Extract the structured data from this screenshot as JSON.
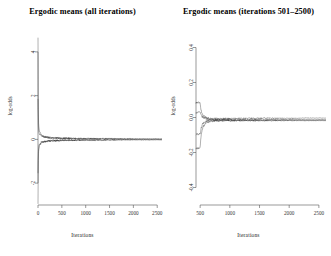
{
  "figure": {
    "background": "#ffffff",
    "axis_color": "#555555",
    "trace_color": "#333333"
  },
  "panels": [
    {
      "id": "left",
      "title": "Ergodic means (all iterations)",
      "xlabel": "Iterations",
      "ylabel": "log-odds"
    },
    {
      "id": "right",
      "title": "Ergodic means (iterations 501–2500)",
      "xlabel": "Iterations",
      "ylabel": "log-odds"
    }
  ],
  "chart_data": [
    {
      "type": "line",
      "title": "Ergodic means (all iterations)",
      "xlabel": "Iterations",
      "ylabel": "log-odds",
      "xlim": [
        0,
        2600
      ],
      "ylim": [
        -3.0,
        5.0
      ],
      "xticks": [
        0,
        500,
        1000,
        1500,
        2000,
        2500
      ],
      "xtick_labels": [
        "0",
        "500",
        "1000",
        "1500",
        "2000",
        "2500"
      ],
      "yticks": [
        -2,
        0,
        2,
        4
      ],
      "ytick_labels": [
        "-2",
        "0",
        "2",
        "4"
      ],
      "grid": false,
      "legend": "none",
      "series": [
        {
          "name": "chain-1",
          "x": [
            1,
            2,
            3,
            5,
            8,
            12,
            18,
            25,
            35,
            50,
            70,
            95,
            125,
            165,
            210,
            270,
            340,
            430,
            540,
            680,
            850,
            1050,
            1300,
            1600,
            1950,
            2300,
            2500
          ],
          "values": [
            4.7,
            3.2,
            2.3,
            1.55,
            1.05,
            0.78,
            0.58,
            0.45,
            0.35,
            0.27,
            0.21,
            0.17,
            0.14,
            0.115,
            0.095,
            0.08,
            0.068,
            0.058,
            0.05,
            0.043,
            0.037,
            0.032,
            0.027,
            0.023,
            0.019,
            0.016,
            0.015
          ]
        },
        {
          "name": "chain-2",
          "x": [
            1,
            2,
            3,
            5,
            8,
            12,
            18,
            25,
            35,
            50,
            70,
            95,
            125,
            165,
            210,
            270,
            340,
            430,
            540,
            680,
            850,
            1050,
            1300,
            1600,
            1950,
            2300,
            2500
          ],
          "values": [
            -2.9,
            -2.1,
            -1.6,
            -1.1,
            -0.78,
            -0.58,
            -0.44,
            -0.34,
            -0.27,
            -0.21,
            -0.17,
            -0.14,
            -0.115,
            -0.095,
            -0.08,
            -0.068,
            -0.058,
            -0.05,
            -0.043,
            -0.037,
            -0.032,
            -0.028,
            -0.024,
            -0.021,
            -0.018,
            -0.016,
            -0.015
          ]
        },
        {
          "name": "chain-3",
          "x": [
            1,
            3,
            6,
            12,
            22,
            40,
            70,
            120,
            200,
            320,
            500,
            800,
            1200,
            1700,
            2200,
            2500
          ],
          "values": [
            1.9,
            1.1,
            0.72,
            0.46,
            0.31,
            0.21,
            0.15,
            0.11,
            0.085,
            0.065,
            0.05,
            0.04,
            0.032,
            0.026,
            0.021,
            0.02
          ]
        },
        {
          "name": "chain-4",
          "x": [
            1,
            3,
            6,
            12,
            22,
            40,
            70,
            120,
            200,
            320,
            500,
            800,
            1200,
            1700,
            2200,
            2500
          ],
          "values": [
            -1.5,
            -0.95,
            -0.63,
            -0.41,
            -0.28,
            -0.19,
            -0.135,
            -0.1,
            -0.078,
            -0.06,
            -0.047,
            -0.038,
            -0.03,
            -0.025,
            -0.02,
            -0.019
          ]
        }
      ]
    },
    {
      "type": "line",
      "title": "Ergodic means (iterations 501–2500)",
      "xlabel": "Iterations",
      "ylabel": "log-odds",
      "xlim": [
        430,
        2620
      ],
      "ylim": [
        -0.5,
        0.5
      ],
      "xticks": [
        500,
        1000,
        1500,
        2000,
        2500
      ],
      "xtick_labels": [
        "500",
        "1000",
        "1500",
        "2000",
        "2500"
      ],
      "yticks": [
        -0.4,
        -0.2,
        0.0,
        0.2,
        0.4
      ],
      "ytick_labels": [
        "-0.4",
        "-0.2",
        "0.0",
        "0.2",
        "0.4"
      ],
      "grid": false,
      "legend": "none",
      "series": [
        {
          "name": "chain-1",
          "x": [
            501,
            510,
            525,
            545,
            570,
            600,
            640,
            690,
            750,
            830,
            930,
            1050,
            1200,
            1380,
            1580,
            1800,
            2050,
            2300,
            2500
          ],
          "values": [
            0.085,
            0.052,
            0.03,
            0.016,
            0.006,
            0.0,
            -0.004,
            -0.006,
            -0.007,
            -0.007,
            -0.006,
            -0.006,
            -0.005,
            -0.005,
            -0.004,
            -0.004,
            -0.004,
            -0.003,
            -0.003
          ]
        },
        {
          "name": "chain-2",
          "x": [
            501,
            510,
            525,
            545,
            570,
            600,
            640,
            690,
            750,
            830,
            930,
            1050,
            1200,
            1380,
            1580,
            1800,
            2050,
            2300,
            2500
          ],
          "values": [
            -0.175,
            -0.125,
            -0.085,
            -0.058,
            -0.042,
            -0.032,
            -0.026,
            -0.022,
            -0.02,
            -0.019,
            -0.018,
            -0.018,
            -0.018,
            -0.018,
            -0.018,
            -0.018,
            -0.018,
            -0.018,
            -0.018
          ]
        },
        {
          "name": "chain-3",
          "x": [
            501,
            515,
            535,
            560,
            595,
            640,
            700,
            780,
            880,
            1000,
            1150,
            1330,
            1540,
            1780,
            2050,
            2320,
            2500
          ],
          "values": [
            0.03,
            0.014,
            0.004,
            -0.002,
            -0.006,
            -0.009,
            -0.011,
            -0.012,
            -0.012,
            -0.013,
            -0.013,
            -0.013,
            -0.013,
            -0.013,
            -0.013,
            -0.013,
            -0.013
          ]
        },
        {
          "name": "chain-4",
          "x": [
            501,
            515,
            535,
            560,
            595,
            640,
            700,
            780,
            880,
            1000,
            1150,
            1330,
            1540,
            1780,
            2050,
            2320,
            2500
          ],
          "values": [
            -0.095,
            -0.062,
            -0.04,
            -0.028,
            -0.022,
            -0.018,
            -0.016,
            -0.015,
            -0.015,
            -0.015,
            -0.015,
            -0.015,
            -0.015,
            -0.015,
            -0.015,
            -0.015,
            -0.015
          ]
        }
      ]
    }
  ]
}
